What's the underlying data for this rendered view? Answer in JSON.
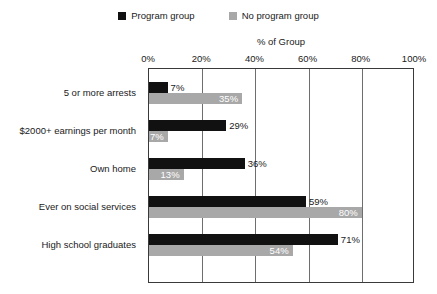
{
  "chart_data": {
    "type": "bar",
    "orientation": "horizontal",
    "title": "",
    "xlabel": "% of Group",
    "ylabel": "",
    "xlim": [
      0,
      100
    ],
    "xticks": [
      "0%",
      "20%",
      "40%",
      "60%",
      "80%",
      "100%"
    ],
    "xtick_values": [
      0,
      20,
      40,
      60,
      80,
      100
    ],
    "grid": true,
    "legend_position": "top-center",
    "categories": [
      "5 or more arrests",
      "$2000+ earnings per month",
      "Own home",
      "Ever on social services",
      "High school graduates"
    ],
    "series": [
      {
        "name": "Program group",
        "color": "#111111",
        "values": [
          7,
          29,
          36,
          59,
          71
        ],
        "labels": [
          "7%",
          "29%",
          "36%",
          "59%",
          "71%"
        ],
        "label_placement": "outside"
      },
      {
        "name": "No program group",
        "color": "#a8a8a8",
        "values": [
          35,
          7,
          13,
          80,
          54
        ],
        "labels": [
          "35%",
          "7%",
          "13%",
          "80%",
          "54%"
        ],
        "label_placement": "inside"
      }
    ]
  },
  "colors": {
    "program_group": "#111111",
    "no_program_group": "#a8a8a8",
    "frame": "#3a3a3a",
    "gridline": "#6e6e6e",
    "text": "#1a1a1a",
    "inside_label_text": "#ffffff",
    "background": "#ffffff"
  }
}
